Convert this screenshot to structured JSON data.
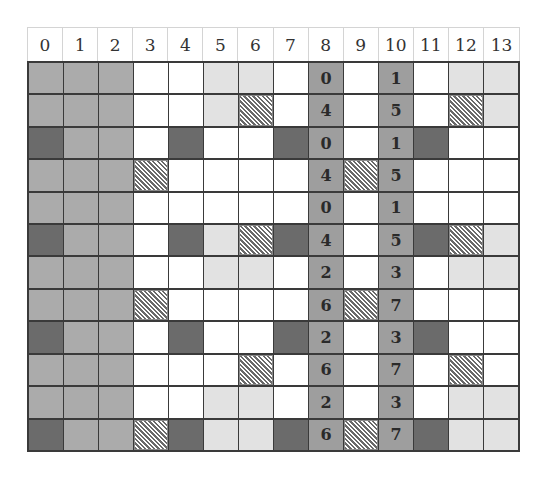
{
  "diagram": {
    "column_headers": [
      "0",
      "1",
      "2",
      "3",
      "4",
      "5",
      "6",
      "7",
      "8",
      "9",
      "10",
      "11",
      "12",
      "13"
    ],
    "legend": {
      "W": {
        "name": "white",
        "color": "#ffffff"
      },
      "L": {
        "name": "light-gray",
        "color": "#e2e2e2"
      },
      "M": {
        "name": "mid-gray",
        "color": "#ababab"
      },
      "D": {
        "name": "dark-gray",
        "color": "#6b6b6b"
      },
      "N": {
        "name": "numbered-gray",
        "color": "#9e9e9e"
      },
      "H": {
        "name": "hatched",
        "color": "#6a6a6a"
      }
    },
    "rows": [
      {
        "fills": [
          "M",
          "M",
          "M",
          "W",
          "W",
          "L",
          "L",
          "W",
          "N",
          "W",
          "N",
          "W",
          "L",
          "L"
        ],
        "labels": {
          "8": "0",
          "10": "1"
        }
      },
      {
        "fills": [
          "M",
          "M",
          "M",
          "W",
          "W",
          "L",
          "H",
          "W",
          "N",
          "W",
          "N",
          "W",
          "H",
          "L"
        ],
        "labels": {
          "8": "4",
          "10": "5"
        }
      },
      {
        "fills": [
          "D",
          "M",
          "M",
          "W",
          "D",
          "W",
          "W",
          "D",
          "N",
          "W",
          "N",
          "D",
          "W",
          "W"
        ],
        "labels": {
          "8": "0",
          "10": "1"
        }
      },
      {
        "fills": [
          "M",
          "M",
          "M",
          "H",
          "W",
          "W",
          "W",
          "W",
          "N",
          "H",
          "N",
          "W",
          "W",
          "W"
        ],
        "labels": {
          "8": "4",
          "10": "5"
        }
      },
      {
        "fills": [
          "M",
          "M",
          "M",
          "W",
          "W",
          "W",
          "W",
          "W",
          "N",
          "W",
          "N",
          "W",
          "W",
          "W"
        ],
        "labels": {
          "8": "0",
          "10": "1"
        }
      },
      {
        "fills": [
          "D",
          "M",
          "M",
          "W",
          "D",
          "L",
          "H",
          "D",
          "N",
          "W",
          "N",
          "D",
          "H",
          "L"
        ],
        "labels": {
          "8": "4",
          "10": "5"
        }
      },
      {
        "fills": [
          "M",
          "M",
          "M",
          "W",
          "W",
          "L",
          "L",
          "W",
          "N",
          "W",
          "N",
          "W",
          "L",
          "L"
        ],
        "labels": {
          "8": "2",
          "10": "3"
        }
      },
      {
        "fills": [
          "M",
          "M",
          "M",
          "H",
          "W",
          "W",
          "W",
          "W",
          "N",
          "H",
          "N",
          "W",
          "W",
          "W"
        ],
        "labels": {
          "8": "6",
          "10": "7"
        }
      },
      {
        "fills": [
          "D",
          "M",
          "M",
          "W",
          "D",
          "W",
          "W",
          "D",
          "N",
          "W",
          "N",
          "D",
          "W",
          "W"
        ],
        "labels": {
          "8": "2",
          "10": "3"
        }
      },
      {
        "fills": [
          "M",
          "M",
          "M",
          "W",
          "W",
          "W",
          "H",
          "W",
          "N",
          "W",
          "N",
          "W",
          "H",
          "W"
        ],
        "labels": {
          "8": "6",
          "10": "7"
        }
      },
      {
        "fills": [
          "M",
          "M",
          "M",
          "W",
          "W",
          "L",
          "L",
          "W",
          "N",
          "W",
          "N",
          "W",
          "L",
          "L"
        ],
        "labels": {
          "8": "2",
          "10": "3"
        }
      },
      {
        "fills": [
          "D",
          "M",
          "M",
          "H",
          "D",
          "L",
          "L",
          "D",
          "N",
          "H",
          "N",
          "D",
          "L",
          "L"
        ],
        "labels": {
          "8": "6",
          "10": "7"
        }
      }
    ]
  }
}
